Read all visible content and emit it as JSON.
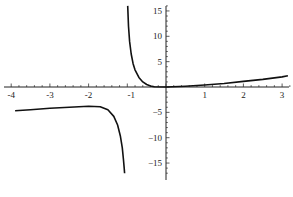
{
  "chart_data": {
    "type": "line",
    "title": "",
    "xlabel": "",
    "ylabel": "",
    "xlim": [
      -4.05,
      3.2
    ],
    "ylim": [
      -17,
      16
    ],
    "grid": false,
    "legend": null,
    "x_ticks": [
      -4,
      -3,
      -2,
      -1,
      1,
      2,
      3
    ],
    "x_tick_labels": [
      "-4",
      "-3",
      "-2",
      "-1",
      "1",
      "2",
      "3"
    ],
    "y_ticks": [
      15,
      10,
      5,
      -5,
      -10,
      -15
    ],
    "y_tick_labels": [
      "15",
      "10",
      "5",
      "−5",
      "−10",
      "−15"
    ],
    "annotations": [
      {
        "type": "vertical-asymptote",
        "x": -1.03
      }
    ],
    "series": [
      {
        "name": "left-branch",
        "x": [
          -3.9,
          -3.5,
          -3.0,
          -2.5,
          -2.0,
          -1.7,
          -1.5,
          -1.35,
          -1.25,
          -1.18,
          -1.13,
          -1.1,
          -1.08,
          -1.07
        ],
        "y": [
          -4.7,
          -4.5,
          -4.2,
          -4.0,
          -3.8,
          -3.9,
          -4.5,
          -5.8,
          -7.5,
          -9.6,
          -12.0,
          -14.2,
          -16.0,
          -17.0
        ]
      },
      {
        "name": "right-branch",
        "x": [
          -0.99,
          -0.97,
          -0.94,
          -0.9,
          -0.85,
          -0.8,
          -0.7,
          -0.6,
          -0.5,
          -0.4,
          -0.3,
          0.0,
          0.5,
          1.0,
          1.5,
          2.0,
          2.5,
          3.0,
          3.15
        ],
        "y": [
          16.0,
          12.0,
          9.0,
          6.5,
          4.6,
          3.4,
          1.9,
          1.0,
          0.5,
          0.2,
          0.05,
          0.0,
          0.15,
          0.4,
          0.7,
          1.1,
          1.5,
          2.0,
          2.2
        ]
      }
    ]
  }
}
